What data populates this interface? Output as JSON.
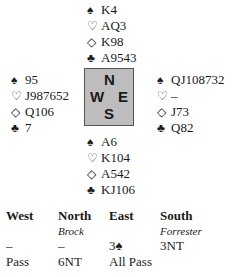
{
  "hands": {
    "north": {
      "spades": "K4",
      "hearts": "AQ3",
      "diamonds": "K98",
      "clubs": "A9543"
    },
    "west": {
      "spades": "95",
      "hearts": "J987652",
      "diamonds": "Q106",
      "clubs": "7"
    },
    "east": {
      "spades": "QJ108732",
      "hearts": "–",
      "diamonds": "J73",
      "clubs": "Q82"
    },
    "south": {
      "spades": "A6",
      "hearts": "K104",
      "diamonds": "A542",
      "clubs": "KJ106"
    }
  },
  "suit_symbols": {
    "spades": "♠",
    "hearts": "♡",
    "diamonds": "◇",
    "clubs": "♣"
  },
  "compass": {
    "n": "N",
    "w": "W",
    "e": "E",
    "s": "S",
    "background_color": "#bdbdbd",
    "border_color": "#555555"
  },
  "auction": {
    "headers": [
      "West",
      "North",
      "East",
      "South"
    ],
    "players": [
      "",
      "Brock",
      "",
      "Forrester"
    ],
    "rounds": [
      [
        "–",
        "–",
        "3♠",
        "3NT"
      ],
      [
        "Pass",
        "6NT",
        "All Pass",
        ""
      ]
    ]
  }
}
